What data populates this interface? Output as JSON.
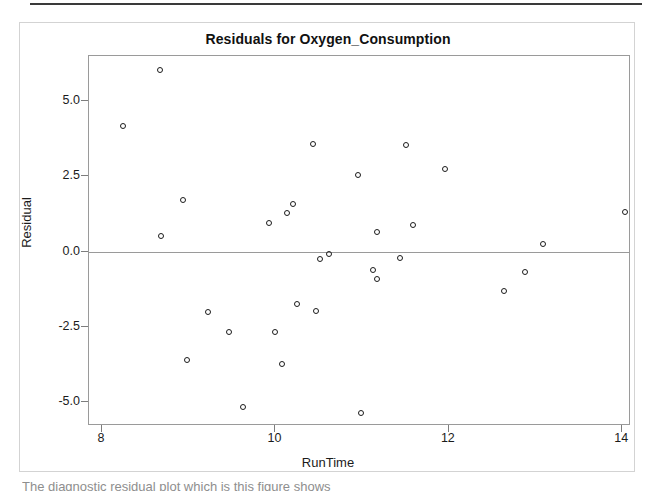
{
  "figure": {
    "title": "Residuals for Oxygen_Consumption",
    "footer_text": "The diagnostic residual plot which is this figure shows"
  },
  "chart_data": {
    "type": "scatter",
    "title": "Residuals for Oxygen_Consumption",
    "xlabel": "RunTime",
    "ylabel": "Residual",
    "xlim": [
      7.85,
      14.1
    ],
    "ylim": [
      -5.8,
      6.5
    ],
    "grid": false,
    "legend": "none",
    "marker": "open-circle",
    "reference_line": 0.0,
    "x_ticks": [
      8,
      10,
      12,
      14
    ],
    "x_tick_labels": [
      "8",
      "10",
      "12",
      "14"
    ],
    "y_ticks": [
      5.0,
      2.5,
      0.0,
      -2.5,
      -5.0
    ],
    "y_tick_labels": [
      "5.0",
      "2.5",
      "0.0",
      "-2.5",
      "-5.0"
    ],
    "points": [
      {
        "x": 8.67,
        "y": 6.05
      },
      {
        "x": 8.24,
        "y": 4.18
      },
      {
        "x": 8.93,
        "y": 1.71
      },
      {
        "x": 8.68,
        "y": 0.51
      },
      {
        "x": 8.98,
        "y": -3.62
      },
      {
        "x": 9.22,
        "y": -2.02
      },
      {
        "x": 9.47,
        "y": -2.69
      },
      {
        "x": 9.63,
        "y": -5.16
      },
      {
        "x": 9.93,
        "y": 0.95
      },
      {
        "x": 10.0,
        "y": -2.66
      },
      {
        "x": 10.07,
        "y": -3.75
      },
      {
        "x": 10.13,
        "y": 1.28
      },
      {
        "x": 10.2,
        "y": 1.58
      },
      {
        "x": 10.25,
        "y": -1.76
      },
      {
        "x": 10.43,
        "y": 3.58
      },
      {
        "x": 10.47,
        "y": -1.97
      },
      {
        "x": 10.51,
        "y": -0.26
      },
      {
        "x": 10.62,
        "y": -0.08
      },
      {
        "x": 10.95,
        "y": 2.54
      },
      {
        "x": 10.99,
        "y": -5.38
      },
      {
        "x": 11.12,
        "y": -0.61
      },
      {
        "x": 11.17,
        "y": 0.65
      },
      {
        "x": 11.17,
        "y": -0.92
      },
      {
        "x": 11.44,
        "y": -0.2
      },
      {
        "x": 11.5,
        "y": 3.54
      },
      {
        "x": 11.59,
        "y": 0.89
      },
      {
        "x": 11.95,
        "y": 2.76
      },
      {
        "x": 12.63,
        "y": -1.32
      },
      {
        "x": 12.88,
        "y": -0.69
      },
      {
        "x": 13.08,
        "y": 0.24
      },
      {
        "x": 14.03,
        "y": 1.3
      }
    ]
  },
  "colors": {
    "marker_stroke": "#1b1b1b",
    "axis": "#9a9a9a",
    "text": "#1b1b1b",
    "frame": "#d3d3d3"
  }
}
